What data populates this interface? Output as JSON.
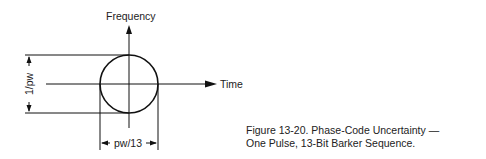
{
  "diagram": {
    "y_axis_label": "Frequency",
    "x_axis_label": "Time",
    "height_dimension": "1/pw",
    "width_dimension": "pw/13",
    "shape": "circle"
  },
  "caption": {
    "line1": "Figure 13-20. Phase-Code Uncertainty —",
    "line2": "One Pulse, 13-Bit Barker Sequence."
  }
}
